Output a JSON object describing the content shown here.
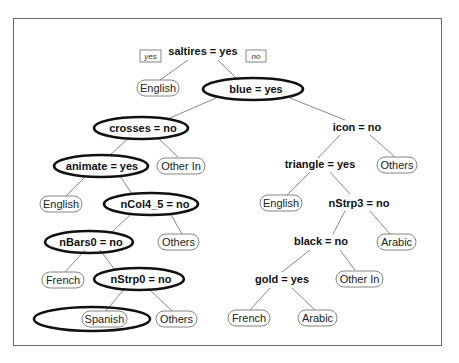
{
  "diagram": {
    "type": "decision-tree",
    "legend": {
      "left_branch": "yes",
      "right_branch": "no"
    },
    "nodes": {
      "root": {
        "label": "saltires = yes"
      },
      "n_english_1": {
        "label": "English"
      },
      "n_blue": {
        "label": "blue = yes"
      },
      "n_crosses": {
        "label": "crosses = no"
      },
      "n_icon": {
        "label": "icon = no"
      },
      "n_animate": {
        "label": "animate = yes"
      },
      "n_otherin_1": {
        "label": "Other In"
      },
      "n_triangle": {
        "label": "triangle = yes"
      },
      "n_others_1": {
        "label": "Others"
      },
      "n_english_2": {
        "label": "English"
      },
      "n_ncol4": {
        "label": "nCol4_5 = no"
      },
      "n_english_3": {
        "label": "English"
      },
      "n_nstrp3": {
        "label": "nStrp3 = no"
      },
      "n_nbars0": {
        "label": "nBars0 = no"
      },
      "n_others_2": {
        "label": "Others"
      },
      "n_black": {
        "label": "black = no"
      },
      "n_arabic_1": {
        "label": "Arabic"
      },
      "n_french_1": {
        "label": "French"
      },
      "n_nstrp0": {
        "label": "nStrp0 = no"
      },
      "n_gold": {
        "label": "gold = yes"
      },
      "n_otherin_2": {
        "label": "Other In"
      },
      "n_spanish": {
        "label": "Spanish"
      },
      "n_others_3": {
        "label": "Others"
      },
      "n_french_2": {
        "label": "French"
      },
      "n_arabic_2": {
        "label": "Arabic"
      }
    },
    "highlighted_path": [
      "n_blue",
      "n_crosses",
      "n_animate",
      "n_ncol4",
      "n_nbars0",
      "n_nstrp0",
      "n_spanish"
    ]
  }
}
